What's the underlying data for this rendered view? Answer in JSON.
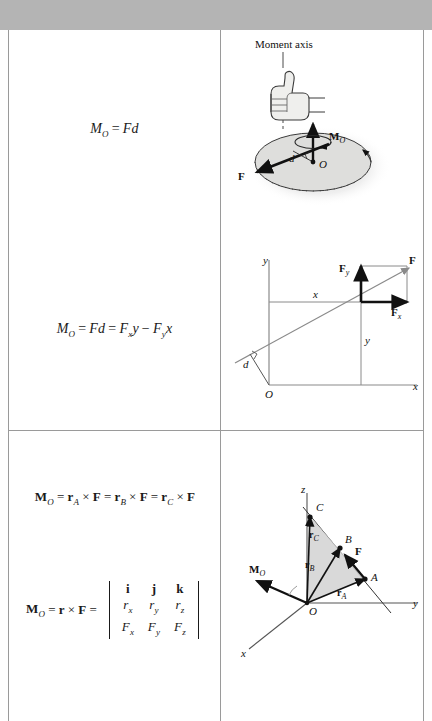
{
  "page": {
    "top_band_color": "#b4b4b4",
    "border_color": "#9a9a9a"
  },
  "rows": [
    {
      "id": "scalar-moment",
      "equation": {
        "lhs_symbol": "M",
        "lhs_sub": "O",
        "equals": "=",
        "rhs": "Fd"
      },
      "figure": {
        "name": "disk-moment-axis-diagram",
        "labels": {
          "moment_axis": "Moment axis",
          "moment_vector": "M",
          "moment_vector_sub": "O",
          "force": "F",
          "distance": "d",
          "origin": "O"
        }
      }
    },
    {
      "id": "moment-components",
      "equation": {
        "lhs_symbol": "M",
        "lhs_sub": "O",
        "term1": "Fd",
        "term2_f": "F",
        "term2_sub": "x",
        "term2_var": "y",
        "minus": "−",
        "term3_f": "F",
        "term3_sub": "y",
        "term3_var": "x"
      },
      "figure": {
        "name": "xy-force-components-diagram",
        "labels": {
          "axis_y": "y",
          "axis_x": "x",
          "origin": "O",
          "force": "F",
          "force_y": "F",
          "force_y_sub": "y",
          "force_x": "F",
          "force_x_sub": "x",
          "dist_x": "x",
          "dist_y": "y",
          "perp_distance": "d"
        }
      }
    },
    {
      "id": "vector-moment",
      "equation_cross": {
        "lhs_symbol": "M",
        "lhs_sub": "O",
        "r_a": "r",
        "r_a_sub": "A",
        "r_b": "r",
        "r_b_sub": "B",
        "r_c": "r",
        "r_c_sub": "C",
        "force": "F",
        "cross": "×",
        "equals": "="
      },
      "equation_determinant": {
        "lhs_symbol": "M",
        "lhs_sub": "O",
        "r": "r",
        "cross": "×",
        "force": "F",
        "equals": "=",
        "matrix": [
          [
            "i",
            "j",
            "k"
          ],
          [
            "rₓ",
            "rᵧ",
            "rᶠ"
          ],
          [
            "Fₓ",
            "Fᵧ",
            "Fᶠ"
          ]
        ],
        "row_unit": [
          "i",
          "j",
          "k"
        ],
        "row_r": {
          "base": "r",
          "subs": [
            "x",
            "y",
            "z"
          ]
        },
        "row_f": {
          "base": "F",
          "subs": [
            "x",
            "y",
            "z"
          ]
        }
      },
      "figure": {
        "name": "three-dimensional-moment-diagram",
        "labels": {
          "axis_x": "x",
          "axis_y": "y",
          "axis_z": "z",
          "origin": "O",
          "point_a": "A",
          "point_b": "B",
          "point_c": "C",
          "vector_ra": "r",
          "vector_ra_sub": "A",
          "vector_rb": "r",
          "vector_rb_sub": "B",
          "vector_rc": "r",
          "vector_rc_sub": "C",
          "force": "F",
          "moment": "M",
          "moment_sub": "O"
        }
      }
    }
  ]
}
